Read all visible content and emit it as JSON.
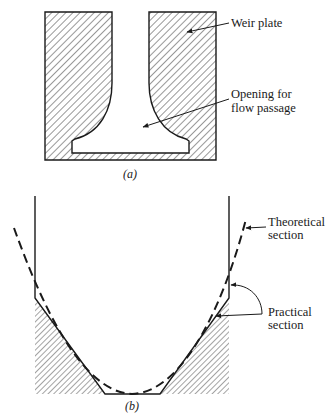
{
  "figure_a": {
    "caption": "(a)",
    "labels": {
      "weir_plate": "Weir plate",
      "opening_line1": "Opening for",
      "opening_line2": "flow passage"
    }
  },
  "figure_b": {
    "caption": "(b)",
    "labels": {
      "theoretical_line1": "Theoretical",
      "theoretical_line2": "section",
      "practical_line1": "Practical",
      "practical_line2": "section"
    }
  },
  "colors": {
    "ink": "#1a1a1a",
    "background": "#ffffff"
  }
}
